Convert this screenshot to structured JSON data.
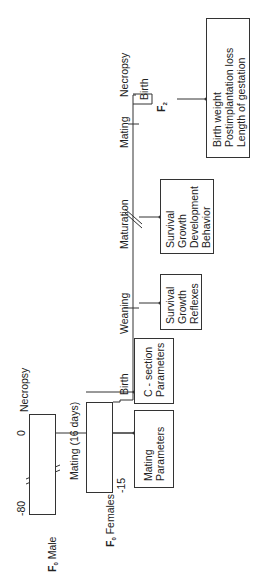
{
  "f0_male": {
    "label": "F",
    "sub": "0",
    "suffix": " Male",
    "tick_start": "-80",
    "tick_zero": "0",
    "event_end": "Necropsy"
  },
  "f0_females": {
    "label": "F",
    "sub": "0",
    "suffix": " Females",
    "tick_start": "-15",
    "mating": "Mating (16 days)"
  },
  "f1": {
    "label": "F",
    "sub": "1",
    "timeline": [
      "Birth",
      "Weaning",
      "Maturation",
      "Mating",
      "Necropsy"
    ]
  },
  "f2": {
    "label": "F",
    "sub": "2",
    "event": "Birth"
  },
  "outcome_boxes": {
    "mating_params": [
      "Mating",
      "Parameters"
    ],
    "csection_params": [
      "C - section",
      "Parameters"
    ],
    "weaning": [
      "Survival",
      "Growth",
      "Reflexes"
    ],
    "maturation": [
      "Survival",
      "Growth",
      "Development",
      "Behavior"
    ],
    "f2_birth": [
      "Birth weight",
      "Postimplantation loss",
      "Length of gestation"
    ]
  }
}
